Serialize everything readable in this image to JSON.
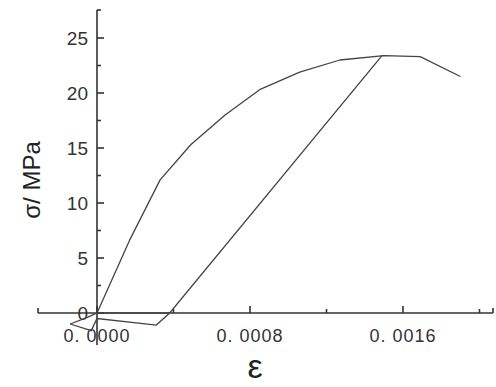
{
  "chart_data": {
    "type": "line",
    "title": "",
    "xlabel": "ε",
    "ylabel": "σ/ MPa",
    "xlim": [
      -5e-05,
      0.0019
    ],
    "ylim": [
      -2,
      27.5
    ],
    "x_ticks": [
      0.0,
      0.0008,
      0.0016
    ],
    "x_tick_labels": [
      "0. 0000",
      "0. 0008",
      "0. 0016"
    ],
    "y_ticks": [
      0,
      5,
      10,
      15,
      20,
      25
    ],
    "y_tick_labels": [
      "0",
      "5",
      "10",
      "15",
      "20",
      "25"
    ],
    "grid": false,
    "legend": null,
    "series": [
      {
        "name": "loading envelope",
        "x": [
          0.0,
          0.00017,
          0.00033,
          0.00049,
          0.00067,
          0.00085,
          0.00106,
          0.00127,
          0.0015,
          0.00169,
          0.0019
        ],
        "y": [
          0.0,
          6.6,
          12.1,
          15.3,
          18.0,
          20.3,
          21.9,
          23.0,
          23.4,
          23.3,
          21.5
        ]
      },
      {
        "name": "unloading branch",
        "x": [
          0.00149,
          0.00038,
          0.00031,
          0.0,
          -3e-05,
          -0.00014
        ],
        "y": [
          23.4,
          0.0,
          -1.1,
          -0.5,
          -1.6,
          -1.0
        ]
      },
      {
        "name": "near-origin loop",
        "x": [
          -0.00014,
          -5e-05,
          0.0,
          0.00038
        ],
        "y": [
          -1.0,
          -0.4,
          0.0,
          0.0
        ]
      }
    ]
  }
}
